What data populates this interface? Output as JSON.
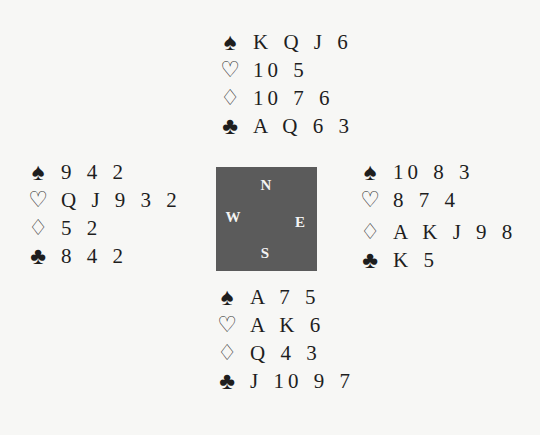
{
  "suits": {
    "spades": "♠",
    "hearts": "♡",
    "diamonds": "♢",
    "clubs": "♣"
  },
  "compass": {
    "north": "N",
    "west": "W",
    "east": "E",
    "south": "S",
    "box_color": "#5b5b5b"
  },
  "hands": {
    "north": {
      "spades": "K Q J 6",
      "hearts": "10 5",
      "diamonds": "10 7 6",
      "clubs": "A Q 6 3"
    },
    "west": {
      "spades": "9 4 2",
      "hearts": "Q J 9 3 2",
      "diamonds": "5 2",
      "clubs": "8 4 2"
    },
    "east": {
      "spades": "10 8 3",
      "hearts": "8 7 4",
      "diamonds": "A K J 9 8",
      "clubs": "K 5"
    },
    "south": {
      "spades": "A 7 5",
      "hearts": "A K 6",
      "diamonds": "Q 4 3",
      "clubs": "J 10 9 7"
    }
  }
}
